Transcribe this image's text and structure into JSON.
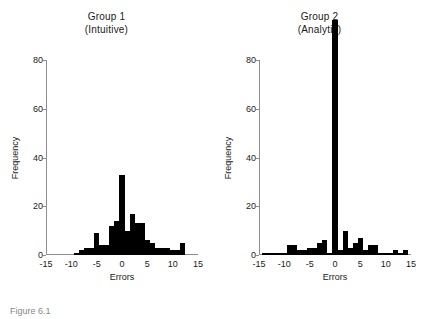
{
  "figure": {
    "caption": "Figure 6.1",
    "background": "#ffffff",
    "bar_color": "#000000",
    "axis_color": "#8d8d8d"
  },
  "axis_labels": {
    "y": "Frequency",
    "x": "Errors"
  },
  "ticks": {
    "y": [
      "0",
      "20",
      "40",
      "60",
      "80"
    ],
    "x": [
      "-15",
      "-10",
      "-5",
      "0",
      "5",
      "10",
      "15"
    ]
  },
  "chart_data": [
    {
      "type": "bar",
      "title": "Group 1",
      "subtitle": "(Intuitive)",
      "xlabel": "Errors",
      "ylabel": "Frequency",
      "xlim": [
        -15,
        15
      ],
      "ylim": [
        0,
        80
      ],
      "grid": false,
      "legend": "none",
      "bin_width": 1,
      "x": [
        -9,
        -8,
        -7,
        -6,
        -5,
        -4,
        -3,
        -2,
        -1,
        0,
        1,
        2,
        3,
        4,
        5,
        6,
        7,
        8,
        9,
        10,
        11,
        12
      ],
      "values": [
        1,
        2,
        3,
        3,
        9,
        4,
        4,
        12,
        14,
        33,
        10,
        17,
        13,
        13,
        6,
        5,
        3,
        3,
        3,
        2,
        2,
        5
      ]
    },
    {
      "type": "bar",
      "title": "Group 2",
      "subtitle": "(Analytic)",
      "xlabel": "Errors",
      "ylabel": "Frequency",
      "xlim": [
        -15,
        15
      ],
      "ylim": [
        0,
        80
      ],
      "grid": false,
      "legend": "none",
      "bin_width": 1,
      "note": "center bar at 0 exceeds the plotted y-axis maximum and is clipped at the top",
      "x": [
        -14,
        -13,
        -12,
        -11,
        -10,
        -9,
        -8,
        -7,
        -6,
        -5,
        -4,
        -3,
        -2,
        -1,
        0,
        1,
        2,
        3,
        4,
        5,
        6,
        7,
        8,
        9,
        10,
        11,
        12,
        13,
        14
      ],
      "values": [
        1,
        1,
        1,
        1,
        1,
        4,
        4,
        2,
        2,
        3,
        3,
        5,
        6,
        1,
        88,
        2,
        10,
        3,
        5,
        7,
        2,
        4,
        4,
        1,
        1,
        1,
        2,
        1,
        2
      ]
    }
  ]
}
